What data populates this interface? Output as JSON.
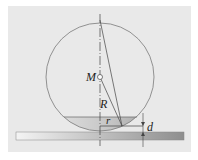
{
  "diagram": {
    "labels": {
      "center": "M",
      "radius": "R",
      "contact_radius": "r",
      "depth": "d"
    },
    "colors": {
      "background": "#e9e9e9",
      "circle_stroke": "#7a7a7a",
      "ground_bar": "#9a9a9a",
      "cap_fill": "#b5b5b5",
      "line": "#444444"
    }
  }
}
